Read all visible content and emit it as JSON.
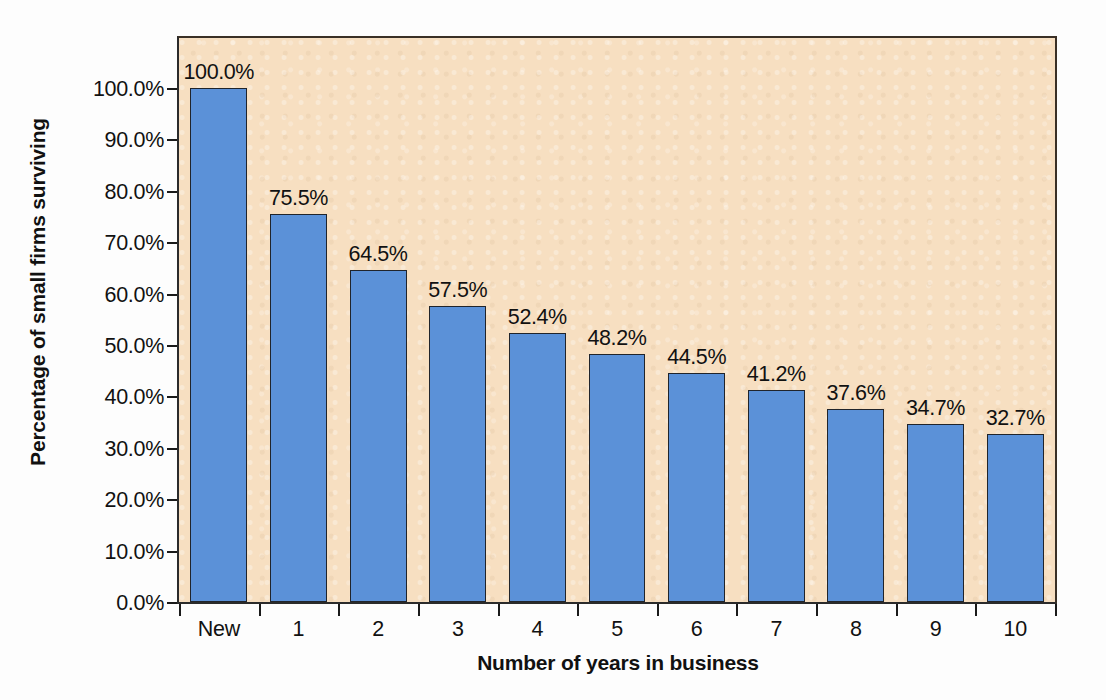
{
  "chart_data": {
    "type": "bar",
    "title": "",
    "subtitle": "",
    "xlabel": "Number of years in business",
    "ylabel": "Percentage of small firms surviving",
    "categories": [
      "New",
      "1",
      "2",
      "3",
      "4",
      "5",
      "6",
      "7",
      "8",
      "9",
      "10"
    ],
    "values": [
      100.0,
      75.5,
      64.5,
      57.5,
      52.4,
      48.2,
      44.5,
      41.2,
      37.6,
      34.7,
      32.7
    ],
    "data_labels": [
      "100.0%",
      "75.5%",
      "64.5%",
      "57.5%",
      "52.4%",
      "48.2%",
      "44.5%",
      "41.2%",
      "37.6%",
      "34.7%",
      "32.7%"
    ],
    "ylim": [
      0,
      105
    ],
    "y_ticks": [
      0,
      10,
      20,
      30,
      40,
      50,
      60,
      70,
      80,
      90,
      100
    ],
    "y_tick_labels": [
      "0.0%",
      "10.0%",
      "20.0%",
      "30.0%",
      "40.0%",
      "50.0%",
      "60.0%",
      "70.0%",
      "80.0%",
      "90.0%",
      "100.0%"
    ],
    "grid": false,
    "legend": "none",
    "series": [
      {
        "name": "Percentage of small firms surviving",
        "values": [
          100.0,
          75.5,
          64.5,
          57.5,
          52.4,
          48.2,
          44.5,
          41.2,
          37.6,
          34.7,
          32.7
        ]
      }
    ],
    "colors": {
      "bar_fill": "#5b91d8",
      "bar_border": "#20242b",
      "plot_background": "#f7dfc1",
      "axis": "#1a1a1a",
      "text": "#111111",
      "figure_background": "#fdfdfd"
    }
  }
}
